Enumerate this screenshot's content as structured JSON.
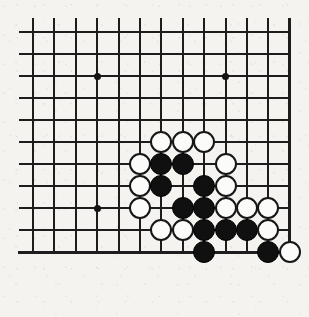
{
  "figure": {
    "kind": "go-board-diagram",
    "background_color": "#f4f3f0",
    "line_color": "#1d1d1d",
    "black_stone_color": "#101010",
    "white_stone_fill": "#fbfbf9",
    "white_stone_border": "#161616"
  },
  "board": {
    "columns": 13,
    "rows": 13,
    "origin_x": 33,
    "origin_y": 32,
    "spacing_x": 21.4,
    "spacing_y": 22.0,
    "left_edge_col": 1,
    "right_edge_col": 13,
    "bottom_edge_row": 11,
    "top_overhang": 14,
    "edge_thick_lines": [
      "right",
      "bottom"
    ],
    "star_points": [
      {
        "col": 4,
        "row": 3
      },
      {
        "col": 10,
        "row": 3
      },
      {
        "col": 4,
        "row": 9
      }
    ]
  },
  "stones": [
    {
      "col": 7,
      "row": 6,
      "color": "white"
    },
    {
      "col": 8,
      "row": 6,
      "color": "white"
    },
    {
      "col": 9,
      "row": 6,
      "color": "white"
    },
    {
      "col": 6,
      "row": 7,
      "color": "white"
    },
    {
      "col": 7,
      "row": 7,
      "color": "black"
    },
    {
      "col": 8,
      "row": 7,
      "color": "black"
    },
    {
      "col": 10,
      "row": 7,
      "color": "white"
    },
    {
      "col": 6,
      "row": 8,
      "color": "white"
    },
    {
      "col": 7,
      "row": 8,
      "color": "black"
    },
    {
      "col": 9,
      "row": 8,
      "color": "black"
    },
    {
      "col": 10,
      "row": 8,
      "color": "white"
    },
    {
      "col": 6,
      "row": 9,
      "color": "white"
    },
    {
      "col": 8,
      "row": 9,
      "color": "black"
    },
    {
      "col": 9,
      "row": 9,
      "color": "black"
    },
    {
      "col": 10,
      "row": 9,
      "color": "white"
    },
    {
      "col": 11,
      "row": 9,
      "color": "white"
    },
    {
      "col": 12,
      "row": 9,
      "color": "white"
    },
    {
      "col": 7,
      "row": 10,
      "color": "white"
    },
    {
      "col": 8,
      "row": 10,
      "color": "white"
    },
    {
      "col": 9,
      "row": 10,
      "color": "black"
    },
    {
      "col": 10,
      "row": 10,
      "color": "black"
    },
    {
      "col": 11,
      "row": 10,
      "color": "black"
    },
    {
      "col": 12,
      "row": 10,
      "color": "white"
    },
    {
      "col": 9,
      "row": 11,
      "color": "black"
    },
    {
      "col": 12,
      "row": 11,
      "color": "black"
    },
    {
      "col": 13,
      "row": 11,
      "color": "white"
    }
  ]
}
